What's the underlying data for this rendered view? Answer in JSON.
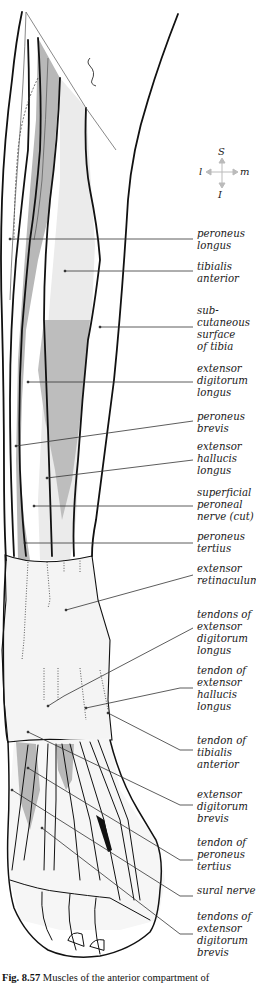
{
  "figure": {
    "caption_number": "Fig. 8.57",
    "caption_text": "Muscles of the anterior compartment of"
  },
  "compass": {
    "superior": "S",
    "inferior": "I",
    "lateral": "l",
    "medial": "m"
  },
  "labels": [
    {
      "id": "peroneus-longus",
      "text": "peroneus\nlongus",
      "top": 228
    },
    {
      "id": "tibialis-anterior",
      "text": "tibialis\nanterior",
      "top": 261
    },
    {
      "id": "subcutaneous-surface-of-tibia",
      "text": "sub-\ncutaneous\nsurface\nof tibia",
      "top": 305
    },
    {
      "id": "extensor-digitorum-longus",
      "text": "extensor\ndigitorum\nlongus",
      "top": 363
    },
    {
      "id": "peroneus-brevis",
      "text": "peroneus\nbrevis",
      "top": 411
    },
    {
      "id": "extensor-hallucis-longus",
      "text": "extensor\nhallucis\nlongus",
      "top": 441
    },
    {
      "id": "superficial-peroneal-nerve-cut",
      "text": "superficial\nperoneal\nnerve (cut)",
      "top": 487
    },
    {
      "id": "peroneus-tertius",
      "text": "peroneus\ntertius",
      "top": 531
    },
    {
      "id": "extensor-retinaculum",
      "text": "extensor\nretinaculum",
      "top": 563
    },
    {
      "id": "tendons-of-extensor-digitorum-longus",
      "text": "tendons of\nextensor\ndigitorum\nlongus",
      "top": 609
    },
    {
      "id": "tendon-of-extensor-hallucis-longus",
      "text": "tendon of\nextensor\nhallucis\nlongus",
      "top": 665
    },
    {
      "id": "tendon-of-tibialis-anterior",
      "text": "tendon of\ntibialis\nanterior",
      "top": 735
    },
    {
      "id": "extensor-digitorum-brevis",
      "text": "extensor\ndigitorum\nbrevis",
      "top": 789
    },
    {
      "id": "tendon-of-peroneus-tertius",
      "text": "tendon of\nperoneus\ntertius",
      "top": 837
    },
    {
      "id": "sural-nerve",
      "text": "sural nerve",
      "top": 885
    },
    {
      "id": "tendons-of-extensor-digitorum-brevis",
      "text": "tendons of\nextensor\ndigitorum\nbrevis",
      "top": 911
    }
  ],
  "colors": {
    "outline": "#111111",
    "muscle_dark": "#b8b8b8",
    "muscle_light": "#ebebeb",
    "leader": "#333333",
    "compass": "#bbbbbb"
  }
}
